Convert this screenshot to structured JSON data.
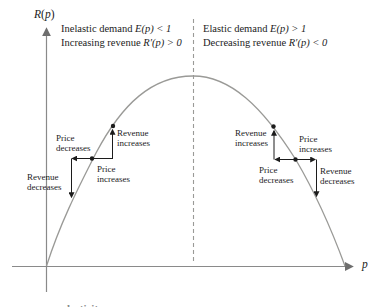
{
  "figure": {
    "y_axis_label": {
      "var1": "R",
      "paren": "(",
      "var2": "p",
      "close": ")"
    },
    "x_axis_label": "p",
    "header_left": {
      "line1": {
        "text": "Inelastic demand ",
        "math": "E(p) < 1"
      },
      "line2": {
        "text": "Increasing revenue ",
        "math": "R′(p) > 0"
      }
    },
    "header_right": {
      "line1": {
        "text": "Elastic demand ",
        "math": "E(p) > 1"
      },
      "line2": {
        "text": "Decreasing revenue ",
        "math": "R′(p) < 0"
      }
    },
    "annotations": {
      "left_branch": {
        "price_decreases": {
          "line1": "Price",
          "line2": "decreases"
        },
        "revenue_increases": {
          "line1": "Revenue",
          "line2": "increases"
        },
        "price_increases": {
          "line1": "Price",
          "line2": "increases"
        },
        "revenue_decreases": {
          "line1": "Revenue",
          "line2": "decreases"
        }
      },
      "right_branch": {
        "revenue_increases": {
          "line1": "Revenue",
          "line2": "increases"
        },
        "price_increases": {
          "line1": "Price",
          "line2": "increases"
        },
        "price_decreases": {
          "line1": "Price",
          "line2": "decreases"
        },
        "revenue_decreases": {
          "line1": "Revenue",
          "line2": "decreases"
        }
      }
    },
    "clipped_caption": "elasticity",
    "colors": {
      "curve": "#9a9a97",
      "axis": "#8a8a8a",
      "dashed_line": "#9a9a97",
      "annotation": "#1c1c1c",
      "text": "#1c1c1c"
    }
  }
}
